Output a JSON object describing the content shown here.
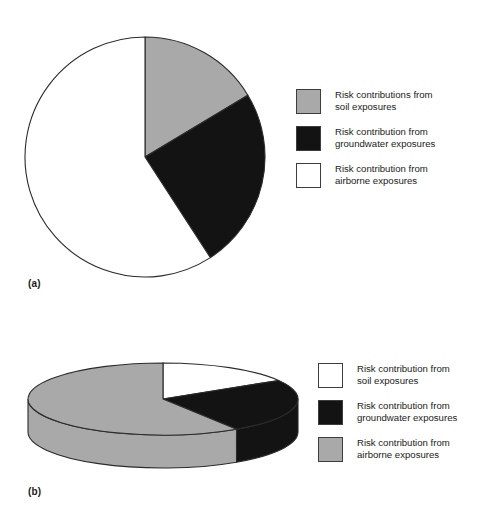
{
  "figure": {
    "panels": [
      {
        "key": "a",
        "label": "(a)",
        "type": "pie-2d"
      },
      {
        "key": "b",
        "label": "(b)",
        "type": "pie-3d"
      }
    ]
  },
  "legend_a": {
    "items": [
      {
        "swatch": "gray",
        "color": "#a9a9a9",
        "label": "Risk contributions from\nsoil exposures"
      },
      {
        "swatch": "black",
        "color": "#131313",
        "label": "Risk contribution from\ngroundwater exposures"
      },
      {
        "swatch": "white",
        "color": "#ffffff",
        "label": "Risk contribution from\nairborne exposures"
      }
    ]
  },
  "legend_b": {
    "items": [
      {
        "swatch": "white",
        "color": "#ffffff",
        "label": "Risk contribution from\nsoil exposures"
      },
      {
        "swatch": "black",
        "color": "#131313",
        "label": "Risk contribution from\ngroundwater exposures"
      },
      {
        "swatch": "gray",
        "color": "#a9a9a9",
        "label": "Risk contribution from\nairborne exposures"
      }
    ]
  },
  "chart_data": [
    {
      "type": "pie",
      "id": "panel-a-pie",
      "title": "",
      "categories": [
        "Risk contributions from soil exposures",
        "Risk contribution from groundwater exposures",
        "Risk contribution from airborne exposures"
      ],
      "values": [
        16.4,
        24.4,
        59.2
      ],
      "units": "percent",
      "colors": [
        "#a9a9a9",
        "#131313",
        "#ffffff"
      ],
      "start_angle_deg": 0,
      "direction": "clockwise",
      "boundaries_deg": [
        0,
        59,
        147,
        360
      ],
      "legend_position": "right",
      "grid": false,
      "center_px": [
        145,
        157
      ],
      "radius_px": 120
    },
    {
      "type": "pie",
      "id": "panel-b-pie",
      "title": "",
      "categories": [
        "Risk contribution from soil exposures",
        "Risk contribution from groundwater exposures",
        "Risk contribution from airborne exposures"
      ],
      "values": [
        16.4,
        24.4,
        59.2
      ],
      "units": "percent",
      "colors": [
        "#ffffff",
        "#131313",
        "#a9a9a9"
      ],
      "start_angle_deg": 0,
      "direction": "clockwise",
      "boundaries_deg": [
        0,
        59,
        147,
        360
      ],
      "legend_position": "right",
      "grid": false,
      "three_d": true,
      "center_px": [
        163,
        399
      ],
      "radius_x_px": 135,
      "radius_y_px": 36,
      "depth_px": 33
    }
  ]
}
